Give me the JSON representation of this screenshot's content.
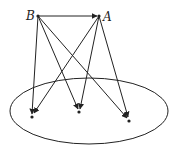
{
  "diagram": {
    "type": "directed-graph",
    "nodes": {
      "B": {
        "label": "B",
        "x": 38,
        "y": 16
      },
      "A": {
        "label": "A",
        "x": 99,
        "y": 16
      }
    },
    "ellipse": {
      "cx": 89,
      "cy": 111,
      "rx": 79,
      "ry": 33
    },
    "targets": [
      {
        "id": "p1",
        "x": 32,
        "y": 117
      },
      {
        "id": "p2",
        "x": 79,
        "y": 112
      },
      {
        "id": "p3",
        "x": 129,
        "y": 121
      }
    ],
    "edges": [
      {
        "from": "B",
        "to": "A"
      },
      {
        "from": "B",
        "to": "p1"
      },
      {
        "from": "B",
        "to": "p2"
      },
      {
        "from": "B",
        "to": "p3"
      },
      {
        "from": "A",
        "to": "p1"
      },
      {
        "from": "A",
        "to": "p2"
      },
      {
        "from": "A",
        "to": "p3"
      }
    ],
    "stroke_color": "#222222"
  }
}
